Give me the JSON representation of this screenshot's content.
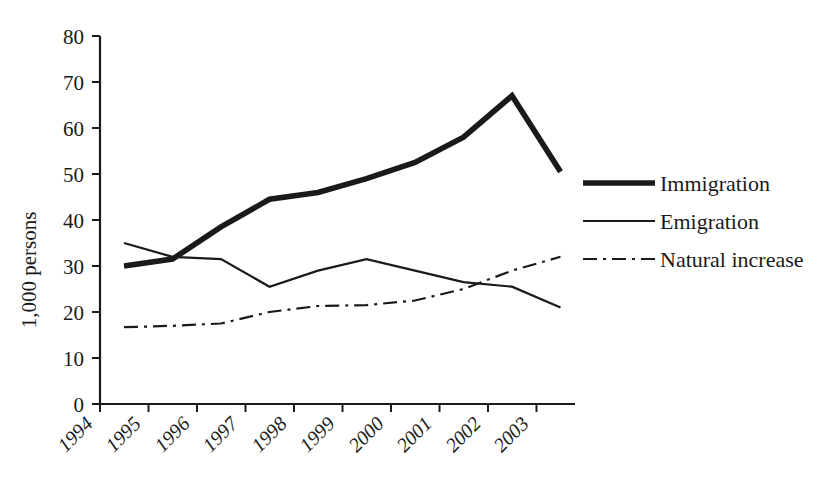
{
  "chart_data": {
    "type": "line",
    "title": "",
    "xlabel": "",
    "ylabel": "1,000 persons",
    "categories": [
      "1994",
      "1995",
      "1996",
      "1997",
      "1998",
      "1999",
      "2000",
      "2001",
      "2002",
      "2003"
    ],
    "x": [
      1994,
      1995,
      1996,
      1997,
      1998,
      1999,
      2000,
      2001,
      2002,
      2003
    ],
    "ylim": [
      0,
      80
    ],
    "yticks": [
      0,
      10,
      20,
      30,
      40,
      50,
      60,
      70,
      80
    ],
    "ytick_labels": [
      "0",
      "10",
      "20",
      "30",
      "40",
      "50",
      "60",
      "70",
      "80"
    ],
    "grid": false,
    "legend_position": "right",
    "series": [
      {
        "name": "Immigration",
        "style": "solid-thick",
        "color": "#1a1a1a",
        "values": [
          30.0,
          31.5,
          38.5,
          44.5,
          46.0,
          49.0,
          52.5,
          58.0,
          67.0,
          50.5
        ]
      },
      {
        "name": "Emigration",
        "style": "solid-thin",
        "color": "#1a1a1a",
        "values": [
          35.0,
          32.0,
          31.5,
          25.5,
          29.0,
          31.5,
          29.0,
          26.5,
          25.5,
          21.0
        ]
      },
      {
        "name": "Natural increase",
        "style": "dash-dot",
        "color": "#1a1a1a",
        "values": [
          16.7,
          17.0,
          17.5,
          20.0,
          21.3,
          21.5,
          22.5,
          25.0,
          29.0,
          32.0
        ]
      }
    ]
  },
  "axes": {
    "y_axis_title": "1,000 persons",
    "y_tick_labels": [
      "80",
      "70",
      "60",
      "50",
      "40",
      "30",
      "20",
      "10",
      "0"
    ],
    "x_tick_labels": [
      "1994",
      "1995",
      "1996",
      "1997",
      "1998",
      "1999",
      "2000",
      "2001",
      "2002",
      "2003"
    ]
  },
  "legend": {
    "entries": [
      {
        "label": "Immigration",
        "swatch": "thick-solid-line-icon"
      },
      {
        "label": "Emigration",
        "swatch": "thin-solid-line-icon"
      },
      {
        "label": "Natural increase",
        "swatch": "dash-dot-line-icon"
      }
    ]
  }
}
